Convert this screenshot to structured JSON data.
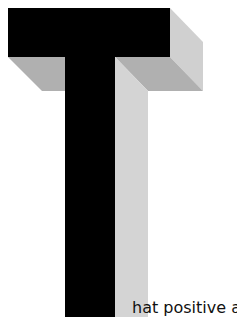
{
  "illustration": {
    "letter": "T",
    "style": "3D extruded drop cap",
    "colors": {
      "front": "#000000",
      "side_light": "#d4d4d4",
      "side_mid": "#b0b0b0",
      "right_face": "#cfcfcf"
    }
  },
  "body_text": {
    "fragment": "hat positive a"
  }
}
